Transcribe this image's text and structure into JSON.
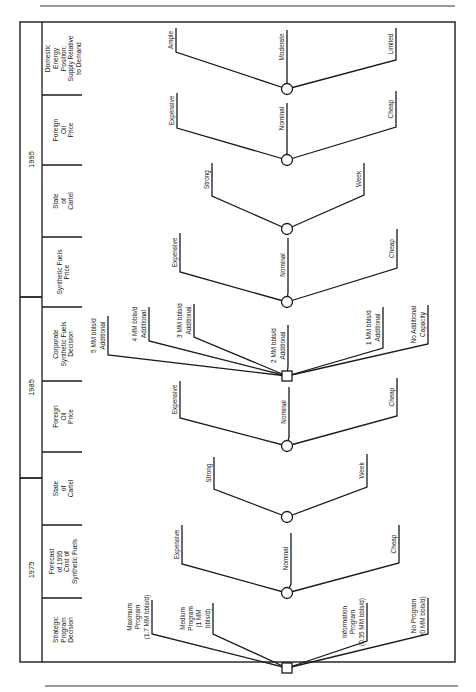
{
  "figure": {
    "orientation": "rotated-90-ccw",
    "frame": {
      "x1": 20,
      "y1": 22,
      "x2": 455,
      "y2": 662
    },
    "top_rule_y": 6,
    "bottom_rule_y": 686,
    "node_x": 287
  },
  "header": {
    "years": [
      {
        "label": "1995",
        "y_top": 22,
        "y_bottom": 297
      },
      {
        "label": "1985",
        "y_top": 297,
        "y_bottom": 478
      },
      {
        "label": "1975",
        "y_top": 478,
        "y_bottom": 662
      }
    ],
    "columns": [
      {
        "lines": [
          "Domestic",
          "Energy",
          "Position:",
          "Supply Relative",
          "to Demand"
        ],
        "y_top": 22,
        "y_bottom": 95
      },
      {
        "lines": [
          "Foreign",
          "Oil",
          "Price"
        ],
        "y_top": 95,
        "y_bottom": 165
      },
      {
        "lines": [
          "State",
          "of",
          "Cartel"
        ],
        "y_top": 165,
        "y_bottom": 237
      },
      {
        "lines": [
          "Synthetic Fuels",
          "Price"
        ],
        "y_top": 237,
        "y_bottom": 307
      },
      {
        "lines": [
          "Corporate",
          "Synthetic Fuels",
          "Decision"
        ],
        "y_top": 307,
        "y_bottom": 381
      },
      {
        "lines": [
          "Foreign",
          "Oil",
          "Price"
        ],
        "y_top": 381,
        "y_bottom": 452
      },
      {
        "lines": [
          "State",
          "of",
          "Cartel"
        ],
        "y_top": 452,
        "y_bottom": 525
      },
      {
        "lines": [
          "Forecast",
          "of 1995",
          "Cost of",
          "Synthetic Fuels"
        ],
        "y_top": 525,
        "y_bottom": 598
      },
      {
        "lines": [
          "Strategic",
          "Program",
          "Decision"
        ],
        "y_top": 598,
        "y_bottom": 662
      }
    ]
  },
  "nodes": [
    {
      "id": "domestic-energy",
      "type": "chance",
      "y": 89,
      "branches": [
        {
          "lines": [
            "Ample"
          ],
          "tip_x": 176,
          "tip_y": 52,
          "stem_top": 28
        },
        {
          "lines": [
            "Moderate"
          ],
          "tip_x": 287,
          "tip_y": 80,
          "stem_top": 30
        },
        {
          "lines": [
            "Limited"
          ],
          "tip_x": 396,
          "tip_y": 60,
          "stem_top": 28
        }
      ]
    },
    {
      "id": "foreign-oil-1995",
      "type": "chance",
      "y": 160,
      "branches": [
        {
          "lines": [
            "Expensive"
          ],
          "tip_x": 177,
          "tip_y": 128,
          "stem_top": 93
        },
        {
          "lines": [
            "Nominal"
          ],
          "tip_x": 287,
          "tip_y": 150,
          "stem_top": 103
        },
        {
          "lines": [
            "Cheap"
          ],
          "tip_x": 396,
          "tip_y": 127,
          "stem_top": 91
        }
      ]
    },
    {
      "id": "cartel-1995",
      "type": "chance",
      "y": 229,
      "branches": [
        {
          "lines": [
            "Strong"
          ],
          "tip_x": 212,
          "tip_y": 196,
          "stem_top": 163
        },
        {
          "lines": [
            "Week"
          ],
          "tip_x": 364,
          "tip_y": 195,
          "stem_top": 163
        }
      ]
    },
    {
      "id": "synfuel-price",
      "type": "chance",
      "y": 302,
      "branches": [
        {
          "lines": [
            "Expensive"
          ],
          "tip_x": 180,
          "tip_y": 272,
          "stem_top": 233
        },
        {
          "lines": [
            "Nominal"
          ],
          "tip_x": 288,
          "tip_y": 292,
          "stem_top": 238
        },
        {
          "lines": [
            "Cheap"
          ],
          "tip_x": 397,
          "tip_y": 268,
          "stem_top": 229
        }
      ]
    },
    {
      "id": "corporate-decision",
      "type": "decision",
      "y": 376,
      "branches": [
        {
          "lines": [
            "5 MM bbls/d",
            "Additional"
          ],
          "tip_x": 108,
          "tip_y": 355,
          "stem_top": 316
        },
        {
          "lines": [
            "4 MM bbls/d",
            "Additional"
          ],
          "tip_x": 149,
          "tip_y": 341,
          "stem_top": 307
        },
        {
          "lines": [
            "3 MM bbls/d",
            "Additional"
          ],
          "tip_x": 194,
          "tip_y": 337,
          "stem_top": 304
        },
        {
          "lines": [
            "2 MM bbls/d",
            "Additional"
          ],
          "tip_x": 288,
          "tip_y": 366,
          "stem_top": 325
        },
        {
          "lines": [
            "1 MM bbls/d",
            "Additional"
          ],
          "tip_x": 383,
          "tip_y": 348,
          "stem_top": 307
        },
        {
          "lines": [
            "No Additional",
            "Capacity"
          ],
          "tip_x": 428,
          "tip_y": 344,
          "stem_top": 305
        }
      ]
    },
    {
      "id": "foreign-oil-1985",
      "type": "chance",
      "y": 446,
      "branches": [
        {
          "lines": [
            "Expensive"
          ],
          "tip_x": 180,
          "tip_y": 418,
          "stem_top": 381
        },
        {
          "lines": [
            "Nominal"
          ],
          "tip_x": 289,
          "tip_y": 437,
          "stem_top": 387
        },
        {
          "lines": [
            "Cheap"
          ],
          "tip_x": 397,
          "tip_y": 416,
          "stem_top": 378
        }
      ]
    },
    {
      "id": "cartel-1985",
      "type": "chance",
      "y": 517,
      "branches": [
        {
          "lines": [
            "Strong"
          ],
          "tip_x": 214,
          "tip_y": 489,
          "stem_top": 457
        },
        {
          "lines": [
            "Week"
          ],
          "tip_x": 367,
          "tip_y": 487,
          "stem_top": 454
        }
      ]
    },
    {
      "id": "forecast-synfuel-cost",
      "type": "chance",
      "y": 593,
      "branches": [
        {
          "lines": [
            "Expensive"
          ],
          "tip_x": 182,
          "tip_y": 564,
          "stem_top": 525
        },
        {
          "lines": [
            "Nominal"
          ],
          "tip_x": 291,
          "tip_y": 584,
          "stem_top": 533
        },
        {
          "lines": [
            "Cheap"
          ],
          "tip_x": 399,
          "tip_y": 563,
          "stem_top": 525
        }
      ]
    },
    {
      "id": "strategic-program",
      "type": "decision",
      "y": 668,
      "branches": [
        {
          "lines": [
            "Maximum",
            "Program",
            "(1.7 MM bbls/d)"
          ],
          "tip_x": 152,
          "tip_y": 634,
          "stem_top": 600
        },
        {
          "lines": [
            "Medium",
            "Program",
            "(1 MM",
            "bbls/d)"
          ],
          "tip_x": 213,
          "tip_y": 634,
          "stem_top": 603
        },
        {
          "lines": [
            "Information",
            "Program",
            "(0.35 MM bbls/d)"
          ],
          "tip_x": 367,
          "tip_y": 641,
          "stem_top": 603
        },
        {
          "lines": [
            "No Program",
            "(0 MM bbls/d)"
          ],
          "tip_x": 428,
          "tip_y": 634,
          "stem_top": 598
        }
      ]
    }
  ]
}
